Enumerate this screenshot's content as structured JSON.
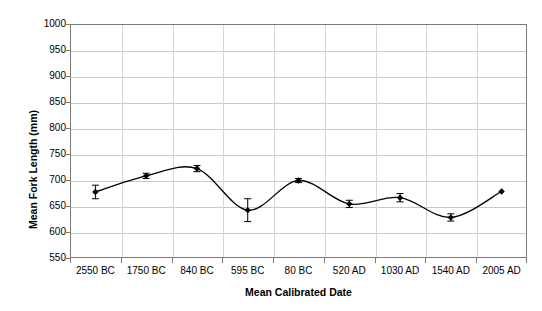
{
  "chart_data": {
    "type": "line",
    "title": "",
    "xlabel": "Mean Calibrated Date",
    "ylabel": "Mean Fork Length (mm)",
    "categories": [
      "2550 BC",
      "1750 BC",
      "840 BC",
      "595 BC",
      "80 BC",
      "520 AD",
      "1030 AD",
      "1540 AD",
      "2005 AD"
    ],
    "values": [
      677,
      708,
      722,
      642,
      699,
      654,
      666,
      628,
      678
    ],
    "error_bars": {
      "type": "symmetric",
      "values": [
        13,
        5,
        6,
        22,
        4,
        7,
        8,
        7,
        0
      ],
      "lower": [
        664,
        703,
        716,
        620,
        695,
        647,
        658,
        621,
        678
      ],
      "upper": [
        690,
        713,
        728,
        664,
        703,
        661,
        674,
        635,
        678
      ]
    },
    "series": [
      {
        "name": "Mean Fork Length",
        "values": [
          677,
          708,
          722,
          642,
          699,
          654,
          666,
          628,
          678
        ],
        "marker": "diamond",
        "marker_color": "#000000",
        "line_color": "#000000",
        "line_smooth": true
      }
    ],
    "ylim": [
      550,
      1000
    ],
    "yticks": [
      550,
      600,
      650,
      700,
      750,
      800,
      850,
      900,
      950,
      1000
    ],
    "ytick_labels": [
      "550",
      "600",
      "650",
      "700",
      "750",
      "800",
      "850",
      "900",
      "950",
      "1000"
    ],
    "grid": {
      "horizontal": true,
      "vertical": true
    },
    "legend": {
      "visible": false,
      "position": "none"
    },
    "axis_color": "#7b7b7b",
    "gridline_color": "#c9c9c9",
    "background_color": "#ffffff"
  }
}
